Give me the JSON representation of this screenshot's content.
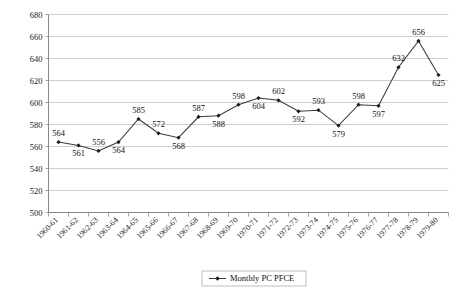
{
  "chart_data": {
    "type": "line",
    "title": "",
    "xlabel": "",
    "ylabel": "",
    "ylim": [
      500,
      680
    ],
    "ytick_step": 20,
    "grid": true,
    "legend_position": "bottom-center",
    "marker": "diamond",
    "categories": [
      "1960-61",
      "1961-62",
      "1962-63",
      "1963-64",
      "1964-65",
      "1965-66",
      "1966-67",
      "1967-68",
      "1968-69",
      "1969-70",
      "1970-71",
      "1971-72",
      "1972-73",
      "1973-74",
      "1974-75",
      "1975-76",
      "1976-77",
      "1977-78",
      "1978-79",
      "1979-80"
    ],
    "yticks": [
      680,
      660,
      640,
      620,
      600,
      580,
      560,
      540,
      520,
      500
    ],
    "series": [
      {
        "name": "Monthly PC PFCE",
        "values": [
          564,
          561,
          556,
          564,
          585,
          572,
          568,
          587,
          588,
          598,
          604,
          602,
          592,
          593,
          579,
          598,
          597,
          632,
          656,
          625
        ],
        "label_positions": [
          "above",
          "below",
          "above",
          "below",
          "above",
          "above",
          "below",
          "above",
          "below",
          "above",
          "below",
          "above",
          "below",
          "above",
          "below",
          "above",
          "below",
          "above",
          "above",
          "below"
        ],
        "color": "#3a3a3a"
      }
    ]
  },
  "legend": {
    "entries": [
      {
        "label": "Monthly PC PFCE"
      }
    ]
  },
  "colors": {
    "series": "#3a3a3a",
    "grid": "#b9b9b9",
    "axis": "#7a7a7a",
    "text": "#111111"
  }
}
